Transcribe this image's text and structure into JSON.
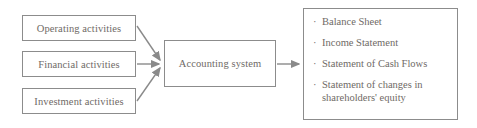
{
  "diagram": {
    "type": "flow-diagram",
    "colors": {
      "border": "#8c8c8c",
      "text": "#6f6a66",
      "arrow": "#8a8a8a",
      "background": "#ffffff"
    },
    "inputs": [
      {
        "label": "Operating activities"
      },
      {
        "label": "Financial activities"
      },
      {
        "label": "Investment activities"
      }
    ],
    "process": {
      "label": "Accounting system"
    },
    "outputs": {
      "bullet": "·",
      "items": [
        {
          "label": "Balance Sheet"
        },
        {
          "label": "Income Statement"
        },
        {
          "label": "Statement of Cash Flows"
        },
        {
          "label": "Statement of changes in shareholders' equity"
        }
      ]
    }
  }
}
